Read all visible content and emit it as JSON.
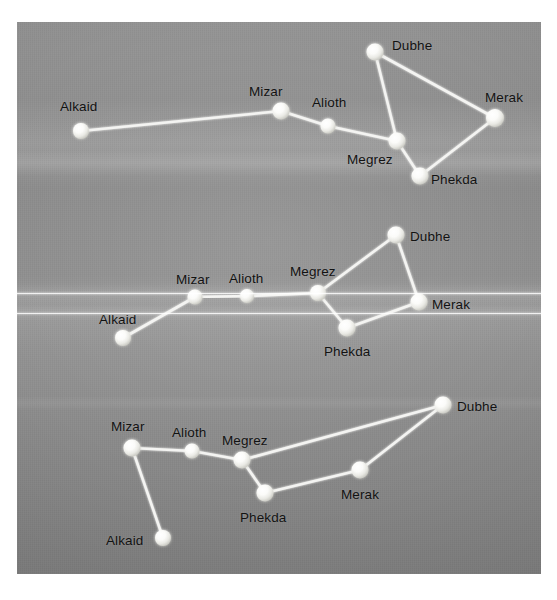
{
  "image": {
    "kind": "photograph-of-printed-diagram",
    "subject": "Big Dipper (Ursa Major) shown in three rotational orientations",
    "photo_frame": {
      "x": 17,
      "y": 22,
      "width": 524,
      "height": 552
    },
    "background_color": "#8d8d8d",
    "star_color": "#f7f7f5",
    "line_color": "#f4f4f2",
    "label_color": "#121212"
  },
  "star_names": [
    "Alkaid",
    "Mizar",
    "Alioth",
    "Megrez",
    "Dubhe",
    "Merak",
    "Phekda"
  ],
  "diagrams": [
    {
      "id": "diagram-top",
      "name": "big-dipper-orientation-1",
      "stars": [
        {
          "name": "Alkaid",
          "x": 81,
          "y": 131,
          "r": 8.0,
          "label_x": 60,
          "label_y": 100
        },
        {
          "name": "Mizar",
          "x": 281,
          "y": 111,
          "r": 8.5,
          "label_x": 249,
          "label_y": 85
        },
        {
          "name": "Alioth",
          "x": 328,
          "y": 126,
          "r": 7.5,
          "label_x": 312,
          "label_y": 96
        },
        {
          "name": "Megrez",
          "x": 397,
          "y": 141,
          "r": 8.5,
          "label_x": 347,
          "label_y": 153
        },
        {
          "name": "Dubhe",
          "x": 375,
          "y": 52,
          "r": 8.5,
          "label_x": 392,
          "label_y": 39
        },
        {
          "name": "Merak",
          "x": 495,
          "y": 118,
          "r": 9.0,
          "label_x": 485,
          "label_y": 91
        },
        {
          "name": "Phekda",
          "x": 420,
          "y": 176,
          "r": 8.5,
          "label_x": 431,
          "label_y": 173
        }
      ],
      "links": [
        [
          "Alkaid",
          "Mizar"
        ],
        [
          "Mizar",
          "Alioth"
        ],
        [
          "Alioth",
          "Megrez"
        ],
        [
          "Megrez",
          "Dubhe"
        ],
        [
          "Dubhe",
          "Merak"
        ],
        [
          "Merak",
          "Phekda"
        ],
        [
          "Phekda",
          "Megrez"
        ]
      ]
    },
    {
      "id": "diagram-middle",
      "name": "big-dipper-orientation-2",
      "stars": [
        {
          "name": "Alkaid",
          "x": 123,
          "y": 338,
          "r": 8.0,
          "label_x": 99,
          "label_y": 313
        },
        {
          "name": "Mizar",
          "x": 195,
          "y": 297,
          "r": 7.5,
          "label_x": 176,
          "label_y": 273
        },
        {
          "name": "Alioth",
          "x": 247,
          "y": 296,
          "r": 7.0,
          "label_x": 229,
          "label_y": 272
        },
        {
          "name": "Megrez",
          "x": 318,
          "y": 293,
          "r": 8.0,
          "label_x": 290,
          "label_y": 265
        },
        {
          "name": "Dubhe",
          "x": 396,
          "y": 235,
          "r": 8.5,
          "label_x": 410,
          "label_y": 230
        },
        {
          "name": "Merak",
          "x": 419,
          "y": 302,
          "r": 8.5,
          "label_x": 432,
          "label_y": 298
        },
        {
          "name": "Phekda",
          "x": 347,
          "y": 328,
          "r": 8.5,
          "label_x": 324,
          "label_y": 345
        }
      ],
      "links": [
        [
          "Alkaid",
          "Mizar"
        ],
        [
          "Mizar",
          "Alioth"
        ],
        [
          "Alioth",
          "Megrez"
        ],
        [
          "Megrez",
          "Dubhe"
        ],
        [
          "Dubhe",
          "Merak"
        ],
        [
          "Merak",
          "Phekda"
        ],
        [
          "Phekda",
          "Megrez"
        ]
      ]
    },
    {
      "id": "diagram-bottom",
      "name": "big-dipper-orientation-3",
      "stars": [
        {
          "name": "Alkaid",
          "x": 163,
          "y": 538,
          "r": 8.0,
          "label_x": 106,
          "label_y": 534
        },
        {
          "name": "Mizar",
          "x": 132,
          "y": 448,
          "r": 8.5,
          "label_x": 111,
          "label_y": 420
        },
        {
          "name": "Alioth",
          "x": 192,
          "y": 451,
          "r": 7.5,
          "label_x": 172,
          "label_y": 426
        },
        {
          "name": "Megrez",
          "x": 242,
          "y": 460,
          "r": 8.5,
          "label_x": 222,
          "label_y": 434
        },
        {
          "name": "Dubhe",
          "x": 443,
          "y": 405,
          "r": 8.5,
          "label_x": 457,
          "label_y": 400
        },
        {
          "name": "Merak",
          "x": 360,
          "y": 470,
          "r": 8.5,
          "label_x": 341,
          "label_y": 488
        },
        {
          "name": "Phekda",
          "x": 265,
          "y": 493,
          "r": 8.5,
          "label_x": 240,
          "label_y": 511
        }
      ],
      "links": [
        [
          "Alkaid",
          "Mizar"
        ],
        [
          "Mizar",
          "Alioth"
        ],
        [
          "Alioth",
          "Megrez"
        ],
        [
          "Megrez",
          "Dubhe"
        ],
        [
          "Dubhe",
          "Merak"
        ],
        [
          "Merak",
          "Phekda"
        ],
        [
          "Phekda",
          "Megrez"
        ]
      ]
    }
  ]
}
